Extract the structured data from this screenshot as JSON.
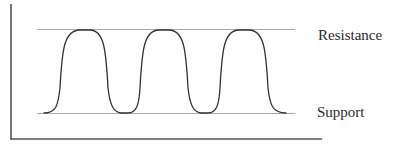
{
  "diagram": {
    "type": "support-resistance oscillation",
    "labels": {
      "resistance": "Resistance",
      "support": "Support"
    },
    "colors": {
      "axis": "#555555",
      "level_line": "#a0a0a0",
      "curve": "#333333",
      "text": "#2a2a2a"
    },
    "geometry": {
      "axis_origin": [
        11,
        139
      ],
      "y_axis_top": 4,
      "x_axis_end": 322,
      "resistance_y": 29,
      "support_y": 113,
      "level_line_x": [
        37,
        295
      ],
      "peaks_x": [
        85,
        164,
        244
      ],
      "troughs_x": [
        125,
        205
      ],
      "curve_x_range": [
        44,
        286
      ]
    }
  }
}
